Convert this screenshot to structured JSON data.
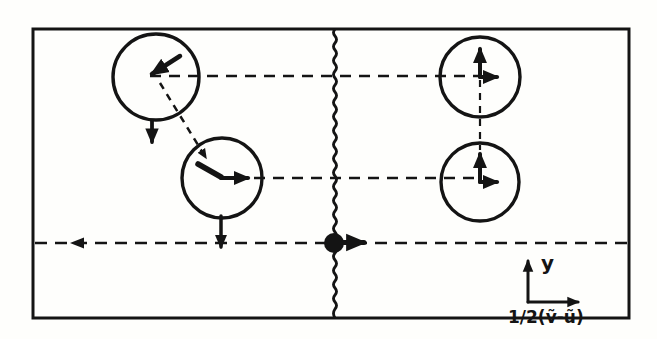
{
  "figure": {
    "kind": "physics-schematic",
    "axes": {
      "y_label": "y",
      "x_label": "1/2(ṽ-ũ)"
    },
    "colors": {
      "ink": "#141414",
      "paper": "#fefefc"
    },
    "shapes": {
      "circle_count": 4,
      "interface": "wavy-vertical-line",
      "particle": "filled-dot-with-right-arrow"
    }
  }
}
